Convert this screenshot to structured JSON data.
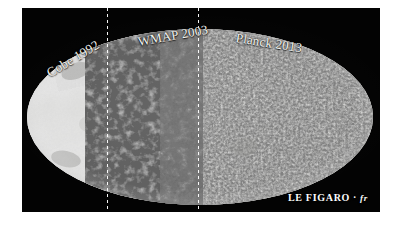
{
  "figure": {
    "kind": "cmb-allsky-mollweide-comparison",
    "background_color": "#ffffff",
    "panel_color": "#030303",
    "label_color": "#f4f4f0",
    "divider_style": "white-dotted-vertical"
  },
  "panels": [
    {
      "id": "cobe",
      "label": "Cobe 1992",
      "rotation_deg": -31,
      "resolution": "coarse",
      "description": "large smooth low-resolution blobs"
    },
    {
      "id": "wmap",
      "label": "WMAP 2003",
      "rotation_deg": -10,
      "resolution": "medium",
      "description": "medium-scale speckled structure"
    },
    {
      "id": "planck",
      "label": "Planck 2013",
      "rotation_deg": 9,
      "resolution": "fine",
      "description": "fine high-resolution grain"
    }
  ],
  "watermark": {
    "brand": "LE FIGARO",
    "separator": "·",
    "suffix": "fr"
  }
}
